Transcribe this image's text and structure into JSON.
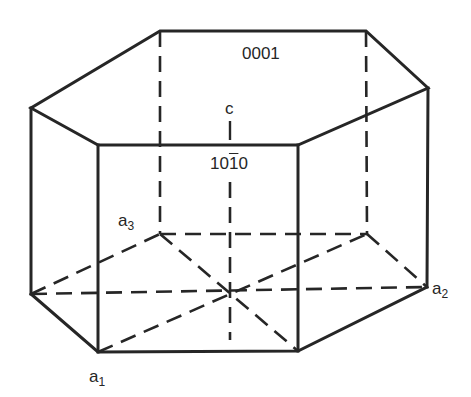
{
  "figure": {
    "line_color": "#262626",
    "background": "#ffffff"
  },
  "labels": {
    "basal_plane": "0001",
    "prism_plane": {
      "d1": "1",
      "d2": "0",
      "d3": "1",
      "d4": "0",
      "full": "10-10"
    },
    "c_axis": "c",
    "a1": {
      "base": "a",
      "sub": "1"
    },
    "a2": {
      "base": "a",
      "sub": "2"
    },
    "a3": {
      "base": "a",
      "sub": "3"
    }
  },
  "geometry": {
    "top_hexagon": [
      [
        160,
        31
      ],
      [
        366,
        31
      ],
      [
        428,
        88
      ],
      [
        298,
        145
      ],
      [
        98,
        145
      ],
      [
        31,
        108
      ]
    ],
    "bottom_hexagon": [
      [
        160,
        234
      ],
      [
        367,
        234
      ],
      [
        427,
        287
      ],
      [
        298,
        351
      ],
      [
        98,
        352
      ],
      [
        31,
        294
      ]
    ],
    "center": [
      230,
      290
    ],
    "c_axis_x": 230
  }
}
